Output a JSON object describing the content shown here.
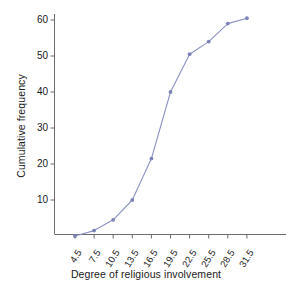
{
  "chart_data": {
    "type": "line",
    "title": "",
    "subtitle": "",
    "xlabel": "Degree of religious involvement",
    "ylabel": "Cumulative frequency",
    "x": [
      4.5,
      7.5,
      10.5,
      13.5,
      16.5,
      19.5,
      22.5,
      25.5,
      28.5,
      31.5
    ],
    "values": [
      0,
      1.5,
      4.5,
      10,
      21.5,
      40,
      50.5,
      54,
      59,
      60.5
    ],
    "xtick_labels": [
      "4.5",
      "7.5",
      "10.5",
      "13.5",
      "16.5",
      "19.5",
      "22.5",
      "25.5",
      "28.5",
      "31.5"
    ],
    "ytick_labels": [
      "10",
      "20",
      "30",
      "40",
      "50",
      "60"
    ],
    "ytick_values": [
      10,
      20,
      30,
      40,
      50,
      60
    ],
    "xlim": [
      3.0,
      33.0
    ],
    "ylim": [
      0,
      63
    ],
    "grid": false,
    "legend": false,
    "legend_position": "none",
    "series": [
      {
        "name": "Cumulative frequency",
        "values": [
          0,
          1.5,
          4.5,
          10,
          21.5,
          40,
          50.5,
          54,
          59,
          60.5
        ],
        "marker": "circle",
        "line_color": "#8b92c4",
        "marker_color": "#7b82b8"
      }
    ],
    "axis_color": "#6b6b6b",
    "text_color": "#1a1a1a",
    "background": "#ffffff"
  }
}
